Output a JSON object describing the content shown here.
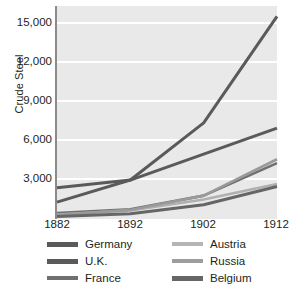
{
  "chart_data": {
    "type": "line",
    "title": "",
    "xlabel": "",
    "ylabel": "Crude Steel",
    "x": [
      1882,
      1892,
      1902,
      1912
    ],
    "xtick_labels": [
      "1882",
      "1892",
      "1902",
      "1912"
    ],
    "ytick_labels": [
      "3,000",
      "6,000",
      "9,000",
      "12,000",
      "15,000"
    ],
    "ytick_values": [
      3000,
      6000,
      9000,
      12000,
      15000
    ],
    "xlim": [
      1882,
      1912
    ],
    "ylim": [
      0,
      16400
    ],
    "grid": "horizontal-white",
    "legend_position": "below-plot-two-columns",
    "plot_background": "#e9e9e9",
    "series": [
      {
        "name": "Germany",
        "color": "#5a5a5a",
        "width": 3.0,
        "values": [
          1300,
          3000,
          7400,
          15600
        ]
      },
      {
        "name": "U.K.",
        "color": "#5a5a5a",
        "width": 3.0,
        "values": [
          2400,
          3000,
          5000,
          7000
        ]
      },
      {
        "name": "France",
        "color": "#707070",
        "width": 2.6,
        "values": [
          450,
          750,
          1800,
          4300
        ]
      },
      {
        "name": "Austria",
        "color": "#b0b0b0",
        "width": 2.6,
        "values": [
          350,
          650,
          1500,
          2700
        ]
      },
      {
        "name": "Russia",
        "color": "#9a9a9a",
        "width": 2.6,
        "values": [
          300,
          700,
          1800,
          4600
        ]
      },
      {
        "name": "Belgium",
        "color": "#666666",
        "width": 3.0,
        "values": [
          200,
          400,
          1100,
          2500
        ]
      }
    ]
  },
  "legend": {
    "left_column": [
      "Germany",
      "U.K.",
      "France"
    ],
    "right_column": [
      "Austria",
      "Russia",
      "Belgium"
    ]
  },
  "caption": {
    "text": ""
  }
}
